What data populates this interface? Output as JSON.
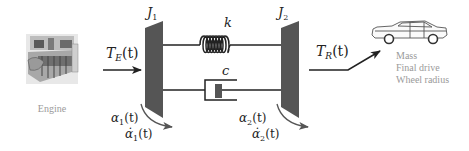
{
  "diagram": {
    "type": "two-mass torsional drivetrain model",
    "colors": {
      "inertia_fill": "#555555",
      "line": "#222222",
      "caption_text": "#9a9a9a",
      "damper_piston": "#555555"
    },
    "engine": {
      "icon": "engine-icon",
      "caption": "Engine"
    },
    "input_torque": {
      "symbol": "T",
      "subscript": "E",
      "arg": "(t)"
    },
    "inertia_1": {
      "symbol": "J",
      "subscript": "1"
    },
    "inertia_2": {
      "symbol": "J",
      "subscript": "2"
    },
    "spring": {
      "label": "k"
    },
    "damper": {
      "label": "c"
    },
    "output_torque": {
      "symbol": "T",
      "subscript": "R",
      "arg": "(t)"
    },
    "angle_1": {
      "symbol": "α",
      "subscript": "1",
      "arg": "(t)"
    },
    "rate_1": {
      "symbol": "α̇",
      "subscript": "1",
      "arg": "(t)"
    },
    "angle_2": {
      "symbol": "α",
      "subscript": "2",
      "arg": "(t)"
    },
    "rate_2": {
      "symbol": "α̇",
      "subscript": "2",
      "arg": "(t)"
    },
    "vehicle": {
      "icon": "car-icon",
      "captions": [
        "Mass",
        "Final drive",
        "Wheel radius"
      ]
    }
  }
}
